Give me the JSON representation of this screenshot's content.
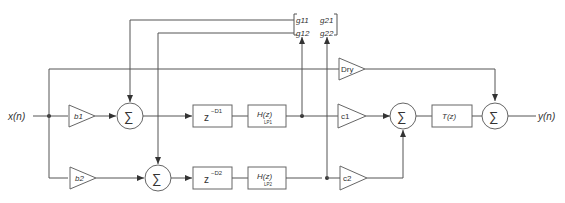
{
  "diagram": {
    "input_label": "x(n)",
    "output_label": "y(n)",
    "gains": {
      "b1": "b1",
      "b2": "b2",
      "c1": "c1",
      "c2": "c2",
      "dry": "Dry"
    },
    "delays": {
      "d1": {
        "base": "z",
        "exp": "−D1"
      },
      "d2": {
        "base": "z",
        "exp": "−D2"
      }
    },
    "filters": {
      "h1": {
        "label": "H(z)",
        "sub": "LP1"
      },
      "h2": {
        "label": "H(z)",
        "sub": "LP2"
      },
      "t": {
        "label": "T(z)"
      }
    },
    "sum_symbol": "∑",
    "matrix": {
      "g11": "g11",
      "g21": "g21",
      "g12": "g12",
      "g22": "g22"
    },
    "colors": {
      "line": "#555555",
      "block_border": "#666666",
      "text": "#333333"
    }
  }
}
